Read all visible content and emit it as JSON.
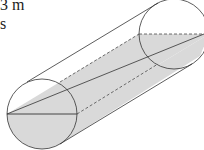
{
  "diagram": {
    "type": "cylinder-cross-section",
    "text_fragments": {
      "top_line": "3 m",
      "second_line": "s"
    },
    "colors": {
      "stroke": "#333333",
      "shade": "#d9d9d9",
      "background": "#ffffff"
    },
    "left_circle": {
      "cx": 42,
      "cy": 114,
      "r": 35
    },
    "right_circle": {
      "cx": 174,
      "cy": 34,
      "r": 35
    }
  }
}
